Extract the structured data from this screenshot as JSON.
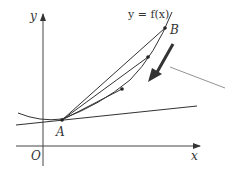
{
  "diagram": {
    "curve_label": "y = f(x)",
    "axis_x_label": "x",
    "axis_y_label": "y",
    "origin_label": "O",
    "point_a_label": "A",
    "point_b_label": "B",
    "colors": {
      "line": "#333333",
      "pointer": "#777777",
      "background": "#ffffff"
    }
  }
}
